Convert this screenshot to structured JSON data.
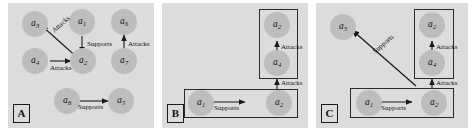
{
  "figure": {
    "background_color": "#ffffff",
    "panel_fill": "#dcdcdc",
    "node_fill": "#bdbdbd",
    "stroke_color": "#2a2a2a"
  },
  "relations": {
    "attacks": "Attacks",
    "supports": "Supports"
  },
  "panels": [
    {
      "id": "A",
      "label": "A",
      "nodes": [
        {
          "id": "a3",
          "base": "a",
          "sub": "3"
        },
        {
          "id": "a1",
          "base": "a",
          "sub": "1"
        },
        {
          "id": "a6",
          "base": "a",
          "sub": "6"
        },
        {
          "id": "a4",
          "base": "a",
          "sub": "4"
        },
        {
          "id": "a2",
          "base": "a",
          "sub": "2"
        },
        {
          "id": "a7",
          "base": "a",
          "sub": "7"
        },
        {
          "id": "a8",
          "base": "a",
          "sub": "8"
        },
        {
          "id": "a5",
          "base": "a",
          "sub": "5"
        }
      ],
      "edges": [
        {
          "from": "a2",
          "to": "a3",
          "label": "Attacks"
        },
        {
          "from": "a1",
          "to": "a2",
          "label": "Supports"
        },
        {
          "from": "a4",
          "to": "a2",
          "label": "Attacks"
        },
        {
          "from": "a7",
          "to": "a6",
          "label": "Attacks"
        },
        {
          "from": "a8",
          "to": "a5",
          "label": "Supports"
        }
      ]
    },
    {
      "id": "B",
      "label": "B",
      "nodes": [
        {
          "id": "a2",
          "base": "a",
          "sub": "2"
        },
        {
          "id": "a4",
          "base": "a",
          "sub": "4"
        },
        {
          "id": "a1",
          "base": "a",
          "sub": "1"
        },
        {
          "id": "a2b",
          "base": "a",
          "sub": "2"
        }
      ],
      "edges": [
        {
          "from": "a4",
          "to": "a2",
          "label": "Attacks"
        },
        {
          "from": "a1",
          "to": "a2b",
          "label": "Supports"
        },
        {
          "from": "bottom-box",
          "to": "top-box",
          "label": "Attacks"
        }
      ]
    },
    {
      "id": "C",
      "label": "C",
      "nodes": [
        {
          "id": "a5",
          "base": "a",
          "sub": "5"
        },
        {
          "id": "a2",
          "base": "a",
          "sub": "2"
        },
        {
          "id": "a4",
          "base": "a",
          "sub": "4"
        },
        {
          "id": "a1",
          "base": "a",
          "sub": "1"
        },
        {
          "id": "a2b",
          "base": "a",
          "sub": "2"
        }
      ],
      "edges": [
        {
          "from": "a4",
          "to": "a2",
          "label": "Attacks"
        },
        {
          "from": "a1",
          "to": "a2b",
          "label": "Supports"
        },
        {
          "from": "bottom-box",
          "to": "top-box",
          "label": "Attacks"
        },
        {
          "from": "bottom-box",
          "to": "a5",
          "label": "Supports"
        }
      ]
    }
  ]
}
